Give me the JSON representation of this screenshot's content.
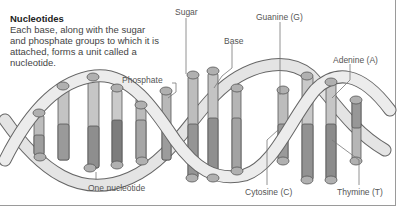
{
  "intro": {
    "title": "Nucleotides",
    "body": "Each base, along with the sugar and phosphate groups to which it is attached, forms a unit called a nucleotide."
  },
  "labels": {
    "sugar": "Sugar",
    "base": "Base",
    "phosphate": "Phosphate",
    "guanine": "Guanine (G)",
    "adenine": "Adenine (A)",
    "cytosine": "Cytosine (C)",
    "thymine": "Thymine (T)",
    "one_nucleotide": "One nucleotide"
  },
  "colors": {
    "strand_fill": "#e6e6e6",
    "strand_stroke": "#666666",
    "base_light": "#c8c8c8",
    "base_mid": "#a8a8a8",
    "base_dark": "#888888",
    "label_text": "#555555",
    "leader_line": "#777777",
    "frame": "#9a9a9a"
  }
}
